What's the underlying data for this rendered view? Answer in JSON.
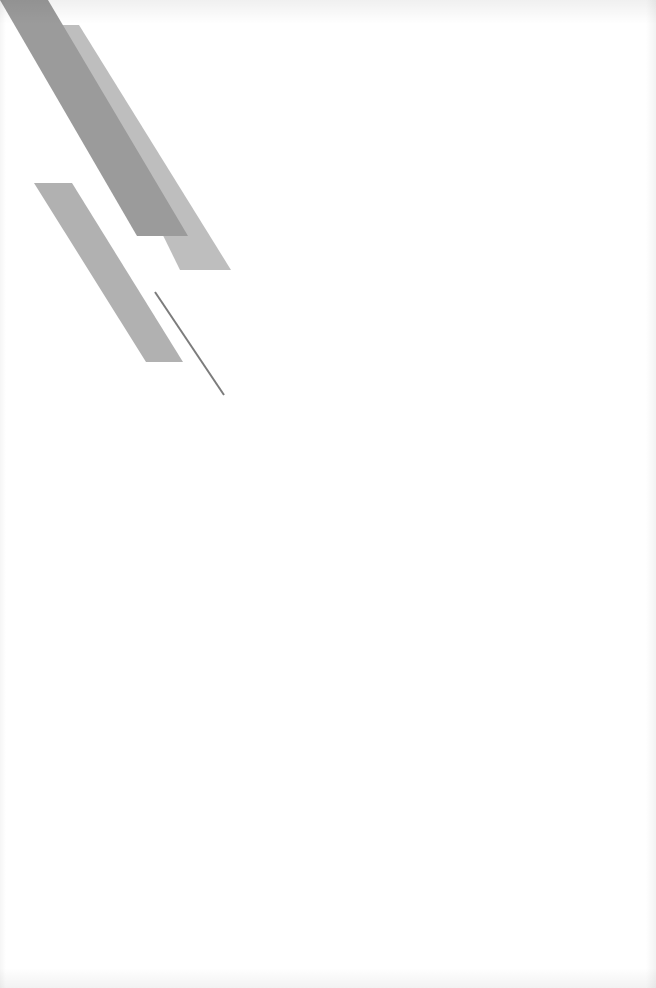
{
  "page": {
    "type": "cover-page",
    "background": "#ffffff",
    "text_content": []
  },
  "decoration": {
    "stripe_dark": {
      "color": "#9b9b9b",
      "points": "0,0 48,0 188,236 137,236"
    },
    "stripe_light": {
      "color": "#bebebe",
      "points": "60,25 79,25 231,270 180,270"
    },
    "stripe_mid": {
      "color": "#b1b1b1",
      "points": "34,183 72,183 183,362 146,362"
    },
    "thin_line": {
      "color": "#7c7c7c",
      "x1": 155,
      "y1": 292,
      "x2": 224,
      "y2": 395,
      "width": 2
    }
  }
}
